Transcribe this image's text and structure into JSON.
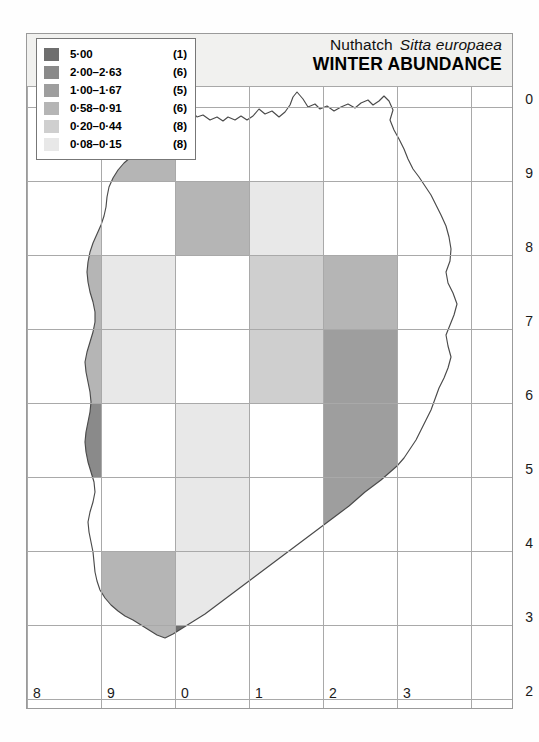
{
  "header": {
    "common_name": "Nuthatch",
    "scientific_name": "Sitta europaea",
    "map_title": "WINTER ABUNDANCE"
  },
  "legend": {
    "items": [
      {
        "range": "5·00",
        "count": "(1)",
        "color": "#6e6e6e"
      },
      {
        "range": "2·00–2·63",
        "count": "(6)",
        "color": "#8a8a8a"
      },
      {
        "range": "1·00–1·67",
        "count": "(5)",
        "color": "#9e9e9e"
      },
      {
        "range": "0·58–0·91",
        "count": "(6)",
        "color": "#b5b5b5"
      },
      {
        "range": "0·20–0·44",
        "count": "(8)",
        "color": "#cfcfcf"
      },
      {
        "range": "0·08–0·15",
        "count": "(8)",
        "color": "#e8e8e8"
      }
    ]
  },
  "axes": {
    "y_labels": [
      "0",
      "9",
      "8",
      "7",
      "6",
      "5",
      "4",
      "3",
      "2"
    ],
    "x_labels": [
      "8",
      "9",
      "0",
      "1",
      "2",
      "3"
    ]
  },
  "colors": {
    "grid_line": "#a9a9a9",
    "frame": "#9a9a9a",
    "header_band": "#f1f1ef",
    "coast_line": "#4a4a4a",
    "background": "#ffffff"
  },
  "chart_data": {
    "type": "heatmap",
    "title": "WINTER ABUNDANCE",
    "subtitle": "Nuthatch Sitta europaea",
    "xlabel": "",
    "ylabel": "",
    "x_tick_labels": [
      "8",
      "9",
      "0",
      "1",
      "2",
      "3"
    ],
    "y_tick_labels": [
      "0",
      "9",
      "8",
      "7",
      "6",
      "5",
      "4",
      "3",
      "2"
    ],
    "grid": true,
    "legend_position": "top-left",
    "value_bins": [
      {
        "label": "5·00",
        "n_squares": 1,
        "color": "#6e6e6e"
      },
      {
        "label": "2·00–2·63",
        "n_squares": 6,
        "color": "#8a8a8a"
      },
      {
        "label": "1·00–1·67",
        "n_squares": 5,
        "color": "#9e9e9e"
      },
      {
        "label": "0·58–0·91",
        "n_squares": 6,
        "color": "#b5b5b5"
      },
      {
        "label": "0·20–0·44",
        "n_squares": 8,
        "color": "#cfcfcf"
      },
      {
        "label": "0·08–0·15",
        "n_squares": 8,
        "color": "#e8e8e8"
      }
    ],
    "columns": [
      "8",
      "9",
      "0",
      "1",
      "2",
      "3"
    ],
    "rows": [
      "0",
      "9",
      "8",
      "7",
      "6",
      "5",
      "4",
      "3",
      "2"
    ],
    "cells": [
      {
        "col": 1,
        "row": 0,
        "bin": 3,
        "color": "#b5b5b5"
      },
      {
        "col": 0,
        "row": 1,
        "bin": 4,
        "color": "#cfcfcf"
      },
      {
        "col": 2,
        "row": 1,
        "bin": 3,
        "color": "#b5b5b5"
      },
      {
        "col": 3,
        "row": 1,
        "bin": 5,
        "color": "#e8e8e8"
      },
      {
        "col": 0,
        "row": 2,
        "bin": 3,
        "color": "#b5b5b5"
      },
      {
        "col": 1,
        "row": 2,
        "bin": 5,
        "color": "#e8e8e8"
      },
      {
        "col": 3,
        "row": 2,
        "bin": 4,
        "color": "#cfcfcf"
      },
      {
        "col": 4,
        "row": 2,
        "bin": 3,
        "color": "#b5b5b5"
      },
      {
        "col": 0,
        "row": 3,
        "bin": 3,
        "color": "#b5b5b5"
      },
      {
        "col": 1,
        "row": 3,
        "bin": 5,
        "color": "#e8e8e8"
      },
      {
        "col": 3,
        "row": 3,
        "bin": 4,
        "color": "#cfcfcf"
      },
      {
        "col": 4,
        "row": 3,
        "bin": 2,
        "color": "#9e9e9e"
      },
      {
        "col": 0,
        "row": 4,
        "bin": 1,
        "color": "#8a8a8a"
      },
      {
        "col": 2,
        "row": 4,
        "bin": 5,
        "color": "#e8e8e8"
      },
      {
        "col": 4,
        "row": 4,
        "bin": 2,
        "color": "#9e9e9e"
      },
      {
        "col": 2,
        "row": 5,
        "bin": 5,
        "color": "#e8e8e8"
      },
      {
        "col": 4,
        "row": 5,
        "bin": 2,
        "color": "#9e9e9e"
      },
      {
        "col": 1,
        "row": 6,
        "bin": 3,
        "color": "#b5b5b5"
      },
      {
        "col": 2,
        "row": 6,
        "bin": 5,
        "color": "#e8e8e8"
      },
      {
        "col": 3,
        "row": 6,
        "bin": 5,
        "color": "#e8e8e8"
      },
      {
        "col": 4,
        "row": 6,
        "bin": 4,
        "color": "#cfcfcf"
      },
      {
        "col": 1,
        "row": 7,
        "bin": 3,
        "color": "#b5b5b5"
      },
      {
        "col": 2,
        "row": 7,
        "bin": 0,
        "color": "#6e6e6e"
      },
      {
        "col": 3,
        "row": 7,
        "bin": 5,
        "color": "#e8e8e8"
      },
      {
        "col": 4,
        "row": 7,
        "bin": 5,
        "color": "#cfcfcf"
      },
      {
        "col": 1,
        "row": 8,
        "bin": 1,
        "color": "#8a8a8a"
      },
      {
        "col": 2,
        "row": 8,
        "bin": 2,
        "color": "#9e9e9e"
      },
      {
        "col": 3,
        "row": 8,
        "bin": 5,
        "color": "#e8e8e8"
      },
      {
        "col": 4,
        "row": 8,
        "bin": 1,
        "color": "#8a8a8a"
      }
    ]
  },
  "map": {
    "coast_path": "M 132,53 L 141,44 L 152,37 L 160,30 L 166,25 L 170,30 L 176,28 L 183,33 L 190,30 L 196,34 L 201,30 L 208,33 L 214,29 L 220,33 L 226,29 L 232,22 L 238,27 L 245,24 L 252,30 L 258,25 L 263,18 L 266,10 L 270,5 L 276,12 L 281,20 L 288,17 L 293,22 L 300,19 L 307,24 L 314,20 L 321,17 L 328,21 L 334,16 L 341,13 L 346,18 L 352,14 L 357,9 L 362,14 L 366,23 L 363,33 L 367,43 L 372,52 L 377,62 L 381,72 L 386,82 L 392,90 L 398,99 L 404,108 L 409,118 L 414,128 L 419,139 L 422,150 L 424,162 L 423,174 L 419,185 L 421,196 L 426,206 L 430,217 L 427,228 L 423,238 L 419,248 L 421,259 L 424,270 L 421,281 L 417,291 L 412,301 L 408,312 L 404,323 L 399,333 L 394,343 L 389,353 L 383,362 L 377,371 L 370,379 L 362,386 L 354,393 L 346,399 L 338,405 L 330,412 L 322,419 L 314,425 L 306,431 L 298,437 L 290,443 L 282,449 L 274,455 L 266,461 L 258,467 L 250,473 L 242,479 L 234,485 L 226,491 L 218,497 L 210,503 L 202,509 L 194,515 L 186,521 L 178,527 L 170,532 L 162,537 L 154,542 L 146,547 L 138,551 L 130,548 L 122,543 L 114,538 L 106,533 L 98,529 L 91,524 L 84,518 L 78,511 L 73,503 L 70,494 L 68,485 L 67,475 L 66,465 L 64,455 L 62,445 L 61,435 L 63,425 L 66,415 L 68,405 L 67,395 L 64,385 L 61,375 L 59,365 L 58,355 L 59,345 L 61,335 L 63,325 L 64,315 L 63,305 L 61,295 L 59,285 L 58,275 L 60,265 L 63,255 L 66,245 L 68,235 L 68,225 L 66,215 L 63,205 L 61,195 L 60,185 L 61,175 L 63,165 L 66,156 L 70,147 L 74,138 L 77,129 L 79,120 L 80,110 L 82,100 L 86,91 L 91,83 L 97,76 L 104,70 L 112,64 L 121,58 Z"
  }
}
